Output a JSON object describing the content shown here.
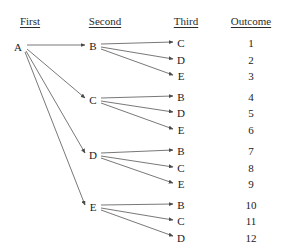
{
  "diagram": {
    "headers": [
      {
        "label": "First",
        "x": 30,
        "y": 16
      },
      {
        "label": "Second",
        "x": 105,
        "y": 16
      },
      {
        "label": "Third",
        "x": 186,
        "y": 16
      },
      {
        "label": "Outcome",
        "x": 251,
        "y": 16
      }
    ],
    "first_nodes": [
      {
        "id": "A",
        "label": "A",
        "x": 18,
        "y": 47
      }
    ],
    "second_nodes": [
      {
        "id": "B",
        "label": "B",
        "x": 93,
        "y": 46
      },
      {
        "id": "C",
        "label": "C",
        "x": 93,
        "y": 100
      },
      {
        "id": "D",
        "label": "D",
        "x": 93,
        "y": 155
      },
      {
        "id": "E",
        "label": "E",
        "x": 93,
        "y": 207
      }
    ],
    "third_nodes": [
      {
        "id": "t1",
        "label": "C",
        "x": 181,
        "y": 43
      },
      {
        "id": "t2",
        "label": "D",
        "x": 181,
        "y": 60
      },
      {
        "id": "t3",
        "label": "E",
        "x": 181,
        "y": 76
      },
      {
        "id": "t4",
        "label": "B",
        "x": 181,
        "y": 97
      },
      {
        "id": "t5",
        "label": "D",
        "x": 181,
        "y": 113
      },
      {
        "id": "t6",
        "label": "E",
        "x": 181,
        "y": 130
      },
      {
        "id": "t7",
        "label": "B",
        "x": 181,
        "y": 151
      },
      {
        "id": "t8",
        "label": "C",
        "x": 181,
        "y": 168
      },
      {
        "id": "t9",
        "label": "E",
        "x": 181,
        "y": 184
      },
      {
        "id": "t10",
        "label": "B",
        "x": 181,
        "y": 205
      },
      {
        "id": "t11",
        "label": "C",
        "x": 181,
        "y": 221
      },
      {
        "id": "t12",
        "label": "D",
        "x": 181,
        "y": 238
      }
    ],
    "outcomes": [
      {
        "label": "1",
        "x": 251,
        "y": 43
      },
      {
        "label": "2",
        "x": 251,
        "y": 60
      },
      {
        "label": "3",
        "x": 251,
        "y": 76
      },
      {
        "label": "4",
        "x": 251,
        "y": 97
      },
      {
        "label": "5",
        "x": 251,
        "y": 113
      },
      {
        "label": "6",
        "x": 251,
        "y": 130
      },
      {
        "label": "7",
        "x": 251,
        "y": 151
      },
      {
        "label": "8",
        "x": 251,
        "y": 168
      },
      {
        "label": "9",
        "x": 251,
        "y": 184
      },
      {
        "label": "10",
        "x": 251,
        "y": 205
      },
      {
        "label": "11",
        "x": 251,
        "y": 221
      },
      {
        "label": "12",
        "x": 251,
        "y": 238
      }
    ],
    "edges": [
      {
        "from": "A",
        "to": "B",
        "x1": 27,
        "y1": 45,
        "x2": 85,
        "y2": 45
      },
      {
        "from": "A",
        "to": "C",
        "x1": 27,
        "y1": 49,
        "x2": 85,
        "y2": 98
      },
      {
        "from": "A",
        "to": "D",
        "x1": 26,
        "y1": 51,
        "x2": 85,
        "y2": 153
      },
      {
        "from": "A",
        "to": "E",
        "x1": 25,
        "y1": 52,
        "x2": 85,
        "y2": 205
      },
      {
        "from": "B",
        "to": "C",
        "x1": 101,
        "y1": 44,
        "x2": 173,
        "y2": 42
      },
      {
        "from": "B",
        "to": "D",
        "x1": 101,
        "y1": 47,
        "x2": 173,
        "y2": 59
      },
      {
        "from": "B",
        "to": "E",
        "x1": 101,
        "y1": 49,
        "x2": 173,
        "y2": 75
      },
      {
        "from": "C",
        "to": "B",
        "x1": 101,
        "y1": 98,
        "x2": 173,
        "y2": 96
      },
      {
        "from": "C",
        "to": "D",
        "x1": 101,
        "y1": 101,
        "x2": 173,
        "y2": 112
      },
      {
        "from": "C",
        "to": "E",
        "x1": 101,
        "y1": 103,
        "x2": 173,
        "y2": 129
      },
      {
        "from": "D",
        "to": "B",
        "x1": 101,
        "y1": 153,
        "x2": 173,
        "y2": 150
      },
      {
        "from": "D",
        "to": "C",
        "x1": 101,
        "y1": 156,
        "x2": 173,
        "y2": 167
      },
      {
        "from": "D",
        "to": "E",
        "x1": 101,
        "y1": 158,
        "x2": 173,
        "y2": 183
      },
      {
        "from": "E",
        "to": "B",
        "x1": 101,
        "y1": 205,
        "x2": 173,
        "y2": 204
      },
      {
        "from": "E",
        "to": "C",
        "x1": 101,
        "y1": 208,
        "x2": 173,
        "y2": 220
      },
      {
        "from": "E",
        "to": "D",
        "x1": 101,
        "y1": 210,
        "x2": 173,
        "y2": 236
      }
    ],
    "colors": {
      "background": "#ffffff",
      "text": "#1a1a1a",
      "edge": "#555555"
    }
  }
}
